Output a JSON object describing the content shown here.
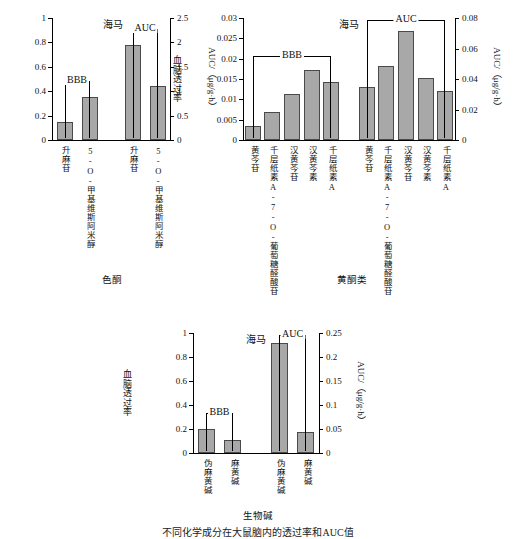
{
  "figure": {
    "caption_bottom": "不同化学成分在大鼠脑内的透过率和AUC值"
  },
  "sections": [
    {
      "name": "section-label-chromone",
      "label": "色酮"
    },
    {
      "name": "section-label-flavonoid",
      "label": "黄酮类"
    },
    {
      "name": "section-label-alkaloid",
      "label": "生物碱"
    }
  ],
  "chart_data": [
    {
      "id": "chromone",
      "type": "bar",
      "title": "海马",
      "ylabel": "血脑透过率",
      "ylabel_right": "AUC/（μg/g·h）",
      "ylim": [
        0,
        1
      ],
      "yticks": [
        "0",
        "0.2",
        "0.4",
        "0.6",
        "0.8",
        "1"
      ],
      "ylim_right": [
        0,
        2.5
      ],
      "yticks_right": [
        "0",
        "0.5",
        "1",
        "1.5",
        "2",
        "2.5"
      ],
      "grid": false,
      "groups": [
        {
          "label": "BBB",
          "axis": "left",
          "categories": [
            "升麻苷",
            "5-O-甲基维斯阿米醇"
          ],
          "values": [
            0.145,
            0.35
          ]
        },
        {
          "label": "AUC",
          "axis": "right",
          "categories": [
            "升麻苷",
            "5-O-甲基维斯阿米醇"
          ],
          "values": [
            1.95,
            1.1
          ]
        }
      ]
    },
    {
      "id": "flavonoid",
      "type": "bar",
      "title": "海马",
      "ylabel": "血脑透过率",
      "ylabel_right": "AUC/（μg/g·h）",
      "ylim": [
        0,
        0.03
      ],
      "yticks": [
        "0",
        "0.005",
        "0.01",
        "0.015",
        "0.02",
        "0.025",
        "0.03"
      ],
      "ylim_right": [
        0,
        0.08
      ],
      "yticks_right": [
        "0",
        "0.02",
        "0.04",
        "0.06",
        "0.08"
      ],
      "grid": false,
      "groups": [
        {
          "label": "BBB",
          "axis": "left",
          "categories": [
            "黄芩苷",
            "千层纸素A-7-O-葡萄糖醛酸苷",
            "汉黄芩苷",
            "汉黄芩素",
            "千层纸素A"
          ],
          "values": [
            0.0035,
            0.007,
            0.0113,
            0.0172,
            0.0142
          ]
        },
        {
          "label": "AUC",
          "axis": "right",
          "categories": [
            "黄芩苷",
            "千层纸素A-7-O-葡萄糖醛酸苷",
            "汉黄芩苷",
            "汉黄芩素",
            "千层纸素A"
          ],
          "values": [
            0.0345,
            0.0487,
            0.0718,
            0.0408,
            0.032
          ]
        }
      ]
    },
    {
      "id": "alkaloid",
      "type": "bar",
      "title": "海马",
      "ylabel": "血脑透过率",
      "ylabel_right": "AUC/（μg/g·h）",
      "ylim": [
        0,
        1
      ],
      "yticks": [
        "0",
        "0.2",
        "0.4",
        "0.6",
        "0.8",
        "1"
      ],
      "ylim_right": [
        0,
        0.25
      ],
      "yticks_right": [
        "0",
        "0.05",
        "0.1",
        "0.15",
        "0.2",
        "0.25"
      ],
      "grid": false,
      "groups": [
        {
          "label": "BBB",
          "axis": "left",
          "categories": [
            "伪麻黄碱",
            "麻黄碱"
          ],
          "values": [
            0.2,
            0.105
          ]
        },
        {
          "label": "AUC",
          "axis": "right",
          "categories": [
            "伪麻黄碱",
            "麻黄碱"
          ],
          "values": [
            0.23,
            0.0435
          ]
        }
      ]
    }
  ]
}
